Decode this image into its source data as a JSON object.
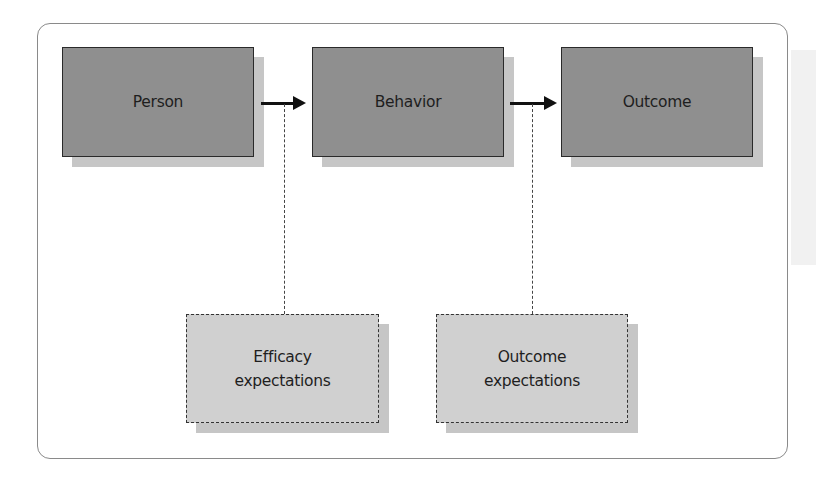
{
  "diagram": {
    "nodes": [
      {
        "id": "person",
        "label": "Person",
        "style": "solid"
      },
      {
        "id": "behavior",
        "label": "Behavior",
        "style": "solid"
      },
      {
        "id": "outcome",
        "label": "Outcome",
        "style": "solid"
      },
      {
        "id": "efficacy",
        "label_line1": "Efficacy",
        "label_line2": "expectations",
        "style": "dashed"
      },
      {
        "id": "outcome_exp",
        "label_line1": "Outcome",
        "label_line2": "expectations",
        "style": "dashed"
      }
    ],
    "edges": [
      {
        "from": "person",
        "to": "behavior",
        "type": "arrow"
      },
      {
        "from": "behavior",
        "to": "outcome",
        "type": "arrow"
      },
      {
        "from": "efficacy",
        "to": "person-behavior-arrow",
        "type": "dashed"
      },
      {
        "from": "outcome_exp",
        "to": "behavior-outcome-arrow",
        "type": "dashed"
      }
    ],
    "colors": {
      "main_fill": "#8f8f8f",
      "dashed_fill": "#d0d0d0",
      "shadow": "#c6c6c6",
      "border": "#2a2a2a"
    }
  }
}
